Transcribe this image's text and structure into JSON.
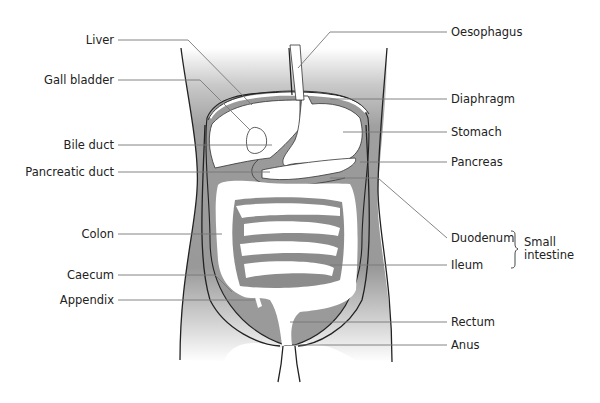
{
  "diagram": {
    "labels_left": [
      {
        "id": "liver",
        "text": "Liver"
      },
      {
        "id": "gall-bladder",
        "text": "Gall bladder"
      },
      {
        "id": "bile-duct",
        "text": "Bile duct"
      },
      {
        "id": "pancreatic-duct",
        "text": "Pancreatic duct"
      },
      {
        "id": "colon",
        "text": "Colon"
      },
      {
        "id": "caecum",
        "text": "Caecum"
      },
      {
        "id": "appendix",
        "text": "Appendix"
      }
    ],
    "labels_right": [
      {
        "id": "oesophagus",
        "text": "Oesophagus"
      },
      {
        "id": "diaphragm",
        "text": "Diaphragm"
      },
      {
        "id": "stomach",
        "text": "Stomach"
      },
      {
        "id": "pancreas",
        "text": "Pancreas"
      },
      {
        "id": "duodenum",
        "text": "Duodenum"
      },
      {
        "id": "ileum",
        "text": "Ileum"
      },
      {
        "id": "rectum",
        "text": "Rectum"
      },
      {
        "id": "anus",
        "text": "Anus"
      }
    ],
    "group_label": {
      "line1": "Small",
      "line2": "intestine"
    },
    "colors": {
      "shade": "#8c8c8c",
      "outline": "#222222",
      "leader": "#777777"
    }
  }
}
